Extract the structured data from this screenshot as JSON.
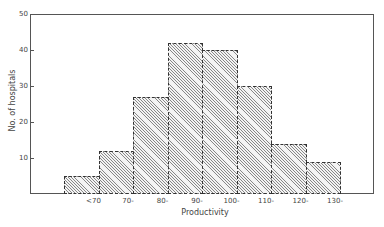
{
  "chart_data": {
    "type": "bar",
    "title": "",
    "xlabel": "Productivity",
    "ylabel": "No. of hospitals",
    "categories": [
      "<70",
      "70-",
      "80-",
      "90-",
      "100-",
      "110-",
      "120-",
      "130-"
    ],
    "values": [
      5,
      12,
      27,
      42,
      40,
      30,
      14,
      9
    ],
    "ylim": [
      0,
      50
    ],
    "yticks": [
      10,
      20,
      30,
      40,
      50
    ],
    "grid": false,
    "legend": null,
    "style": "histogram, diagonal hatched bars"
  },
  "colors": {
    "axis": "#555555",
    "hatch": "#888888",
    "background": "#ffffff"
  }
}
